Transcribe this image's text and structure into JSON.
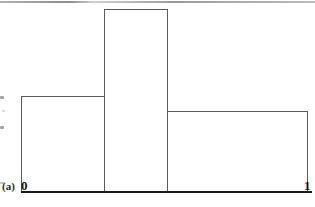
{
  "figure": {
    "panel_caption": "(a)",
    "axis": {
      "start_label": "0",
      "end_label": "1"
    },
    "colors": {
      "stroke": "#5a5a5a",
      "axis": "#1a1a1a",
      "text": "#111111",
      "background": "#ffffff"
    }
  },
  "chart_data": {
    "type": "bar",
    "title": "",
    "subtitle": "",
    "xlabel": "",
    "ylabel": "",
    "categories": [
      "0 to 0.29",
      "0.29 to 0.51",
      "0.51 to 1"
    ],
    "values": [
      95,
      182,
      80
    ],
    "bin_edges": [
      0,
      0.29,
      0.51,
      1
    ],
    "xlim": [
      0,
      1
    ],
    "ylim": [
      0,
      200
    ],
    "grid": false,
    "legend": null,
    "tick_labels_x": [
      "0",
      "1"
    ],
    "tick_labels_y": [],
    "annotations": [
      "(a)"
    ],
    "style": "unfilled outlined step function / piecewise-constant density"
  }
}
